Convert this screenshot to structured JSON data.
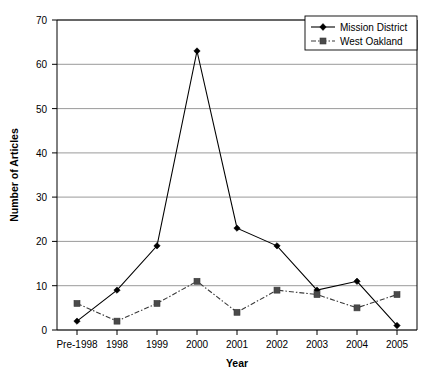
{
  "chart_data": {
    "type": "line",
    "title": "",
    "xlabel": "Year",
    "ylabel": "Number of Articles",
    "categories": [
      "Pre-1998",
      "1998",
      "1999",
      "2000",
      "2001",
      "2002",
      "2003",
      "2004",
      "2005"
    ],
    "series": [
      {
        "name": "Mission District",
        "values": [
          2,
          9,
          19,
          63,
          23,
          19,
          9,
          11,
          1
        ],
        "marker": "diamond",
        "linestyle": "solid",
        "color": "#000000"
      },
      {
        "name": "West Oakland",
        "values": [
          6,
          2,
          6,
          11,
          4,
          9,
          8,
          5,
          8
        ],
        "marker": "square",
        "linestyle": "dash-dot",
        "color": "#3a3a3a"
      }
    ],
    "ylim": [
      0,
      70
    ],
    "yticks": [
      0,
      10,
      20,
      30,
      40,
      50,
      60,
      70
    ],
    "ytick_labels": [
      "0",
      "10",
      "20",
      "30",
      "40",
      "50",
      "60",
      "70"
    ],
    "grid": "horizontal",
    "legend_position": "top-right",
    "legend_entries": [
      "Mission District",
      "West Oakland"
    ]
  },
  "axes": {
    "y_title": "Number of Articles",
    "x_title": "Year"
  },
  "legend": {
    "entry_0": "Mission District",
    "entry_1": "West Oakland"
  },
  "ticks": {
    "y": [
      "0",
      "10",
      "20",
      "30",
      "40",
      "50",
      "60",
      "70"
    ],
    "x": [
      "Pre-1998",
      "1998",
      "1999",
      "2000",
      "2001",
      "2002",
      "2003",
      "2004",
      "2005"
    ]
  }
}
